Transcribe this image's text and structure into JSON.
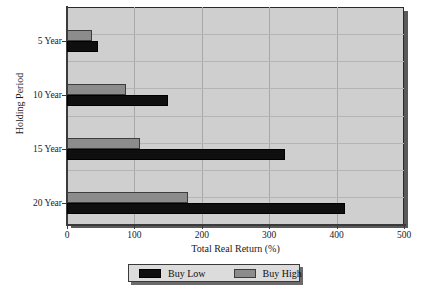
{
  "chart_data": {
    "type": "bar",
    "orientation": "horizontal",
    "title": "",
    "xlabel": "Total Real Return (%)",
    "ylabel": "Holding Period",
    "categories": [
      "5 Year",
      "10 Year",
      "15 Year",
      "20 Year"
    ],
    "series": [
      {
        "name": "Buy Low",
        "color": "#100f0f",
        "values": [
          46,
          150,
          324,
          413
        ]
      },
      {
        "name": "Buy High",
        "color": "#8c8c8c",
        "values": [
          37,
          88,
          109,
          180
        ]
      }
    ],
    "xlim": [
      0,
      500
    ],
    "xticks": [
      0,
      100,
      200,
      300,
      400,
      500
    ],
    "xtick_labels": [
      "0",
      "100",
      "200",
      "300",
      "400",
      "500"
    ],
    "grid": true,
    "grid_axis": "both",
    "legend_position": "below-axes",
    "legend_entries": [
      "Buy Low",
      "Buy High"
    ],
    "plot_background": "#cfcfcf"
  },
  "axes": {
    "x_title": "Total Real Return (%)",
    "y_title": "Holding Period",
    "x_tick_labels": [
      "0",
      "100",
      "200",
      "300",
      "400",
      "500"
    ],
    "y_tick_labels": [
      "5 Year",
      "10 Year",
      "15 Year",
      "20 Year"
    ]
  },
  "legend": {
    "items": [
      {
        "label": "Buy Low",
        "swatch": "black-swatch"
      },
      {
        "label": "Buy High",
        "swatch": "gray-swatch"
      }
    ]
  }
}
